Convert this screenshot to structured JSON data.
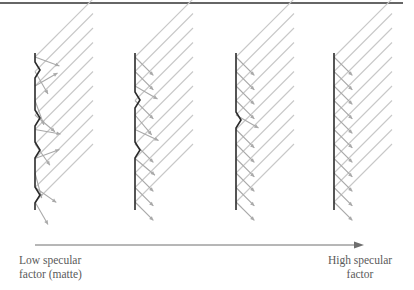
{
  "axis": {
    "low_label_line1": "Low specular",
    "low_label_line2": "factor (matte)",
    "high_label_line1": "High specular",
    "high_label_line2": "factor"
  },
  "colors": {
    "surface": "#2b2b2b",
    "ray": "#c8c8c8",
    "reflected": "#a9a9a9",
    "arrow": "#6e6e6e",
    "rule": "#333333"
  },
  "panels": [
    {
      "name": "matte",
      "bumps": 4,
      "scatter": "high"
    },
    {
      "name": "low-mid",
      "bumps": 2,
      "scatter": "medium"
    },
    {
      "name": "high-mid",
      "bumps": 1,
      "scatter": "low"
    },
    {
      "name": "mirror",
      "bumps": 0,
      "scatter": "none"
    }
  ]
}
